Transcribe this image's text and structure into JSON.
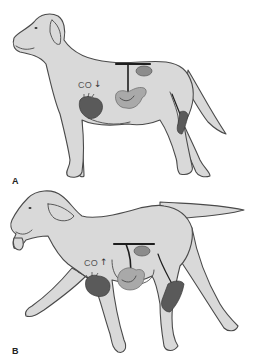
{
  "figure": {
    "colors": {
      "body_fill": "#d9d9d9",
      "outline": "#4a4a4a",
      "heart": "#5a5a5a",
      "viscera": "#a9a9a9",
      "muscle": "#5a5a5a",
      "vessel": "#1e1e1e"
    },
    "panels": [
      {
        "label": "A",
        "state": "standing",
        "co_label": "CO",
        "co_arrow": "↓",
        "co_direction": "decreased",
        "organs": [
          "heart-icon",
          "kidney-icon",
          "intestine-icon",
          "hindlimb-muscle-icon"
        ]
      },
      {
        "label": "B",
        "state": "trotting",
        "co_label": "CO",
        "co_arrow": "↑",
        "co_direction": "increased",
        "organs": [
          "heart-icon",
          "kidney-icon",
          "intestine-icon",
          "hindlimb-muscle-icon"
        ]
      }
    ]
  }
}
